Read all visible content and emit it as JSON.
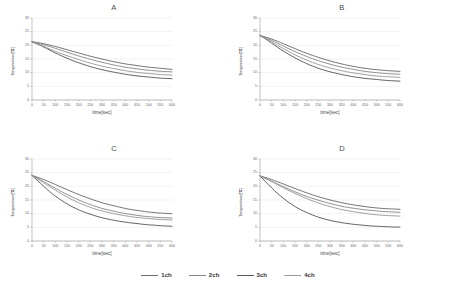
{
  "figure": {
    "title": "",
    "panels": [
      "A",
      "B",
      "C",
      "D"
    ]
  },
  "legend": {
    "position": "bottom-center",
    "items": [
      {
        "label": "1ch",
        "color": "#6b6b6b"
      },
      {
        "label": "2ch",
        "color": "#8a8a8a"
      },
      {
        "label": "3ch",
        "color": "#5a5a5a"
      },
      {
        "label": "4ch",
        "color": "#9a9a9a"
      }
    ]
  },
  "axes": {
    "xlabel": "time[sec]",
    "ylabel": "Temperature[℃]",
    "xticks": [
      0,
      50,
      100,
      150,
      200,
      250,
      300,
      350,
      400,
      450,
      500,
      550,
      600
    ],
    "yticks": [
      0,
      5,
      10,
      15,
      20,
      25,
      30
    ],
    "xlim": [
      0,
      600
    ],
    "ylim": [
      0,
      30
    ],
    "grid": "horizontal"
  },
  "chart_data": [
    {
      "type": "line",
      "title": "A",
      "xlabel": "time[sec]",
      "ylabel": "Temperature[℃]",
      "xlim": [
        0,
        600
      ],
      "ylim": [
        0,
        30
      ],
      "grid": true,
      "x": [
        0,
        25,
        50,
        75,
        100,
        125,
        150,
        175,
        200,
        225,
        250,
        275,
        300,
        325,
        350,
        375,
        400,
        425,
        450,
        475,
        500,
        525,
        550,
        575,
        600
      ],
      "series": [
        {
          "name": "1ch",
          "color": "#6b6b6b",
          "values": [
            21.3,
            21.0,
            20.6,
            20.1,
            19.6,
            19.0,
            18.4,
            17.8,
            17.2,
            16.6,
            16.0,
            15.5,
            15.0,
            14.5,
            14.0,
            13.6,
            13.2,
            12.9,
            12.6,
            12.3,
            12.0,
            11.8,
            11.6,
            11.4,
            11.2
          ]
        },
        {
          "name": "2ch",
          "color": "#8a8a8a",
          "values": [
            21.3,
            20.8,
            20.2,
            19.6,
            18.9,
            18.2,
            17.5,
            16.8,
            16.1,
            15.5,
            14.9,
            14.3,
            13.8,
            13.3,
            12.8,
            12.4,
            12.0,
            11.7,
            11.4,
            11.1,
            10.9,
            10.7,
            10.5,
            10.4,
            10.3
          ]
        },
        {
          "name": "3ch",
          "color": "#5a5a5a",
          "values": [
            21.3,
            20.4,
            19.4,
            18.3,
            17.2,
            16.2,
            15.3,
            14.4,
            13.6,
            12.9,
            12.2,
            11.6,
            11.1,
            10.6,
            10.2,
            9.8,
            9.4,
            9.1,
            8.8,
            8.6,
            8.4,
            8.2,
            8.0,
            7.9,
            7.8
          ]
        },
        {
          "name": "4ch",
          "color": "#9a9a9a",
          "values": [
            21.3,
            20.5,
            19.6,
            18.7,
            17.8,
            17.0,
            16.2,
            15.5,
            14.8,
            14.1,
            13.5,
            12.9,
            12.4,
            11.9,
            11.5,
            11.1,
            10.7,
            10.4,
            10.1,
            9.9,
            9.7,
            9.5,
            9.3,
            9.2,
            9.1
          ]
        }
      ]
    },
    {
      "type": "line",
      "title": "B",
      "xlabel": "time[sec]",
      "ylabel": "Temperature[℃]",
      "xlim": [
        0,
        600
      ],
      "ylim": [
        0,
        30
      ],
      "grid": true,
      "x": [
        0,
        25,
        50,
        75,
        100,
        125,
        150,
        175,
        200,
        225,
        250,
        275,
        300,
        325,
        350,
        375,
        400,
        425,
        450,
        475,
        500,
        525,
        550,
        575,
        600
      ],
      "series": [
        {
          "name": "1ch",
          "color": "#6b6b6b",
          "values": [
            23.6,
            23.0,
            22.3,
            21.5,
            20.6,
            19.7,
            18.8,
            17.9,
            17.1,
            16.3,
            15.6,
            14.9,
            14.3,
            13.7,
            13.2,
            12.7,
            12.3,
            11.9,
            11.6,
            11.3,
            11.1,
            10.9,
            10.7,
            10.6,
            10.5
          ]
        },
        {
          "name": "2ch",
          "color": "#8a8a8a",
          "values": [
            23.6,
            22.7,
            21.8,
            20.8,
            19.7,
            18.7,
            17.7,
            16.8,
            15.9,
            15.1,
            14.4,
            13.7,
            13.1,
            12.5,
            12.0,
            11.6,
            11.2,
            10.8,
            10.5,
            10.2,
            10.0,
            9.8,
            9.6,
            9.5,
            9.4
          ]
        },
        {
          "name": "3ch",
          "color": "#5a5a5a",
          "values": [
            23.6,
            22.3,
            20.8,
            19.3,
            17.9,
            16.6,
            15.4,
            14.3,
            13.3,
            12.4,
            11.6,
            10.9,
            10.3,
            9.8,
            9.3,
            8.9,
            8.5,
            8.2,
            7.9,
            7.7,
            7.5,
            7.3,
            7.1,
            7.0,
            6.9
          ]
        },
        {
          "name": "4ch",
          "color": "#9a9a9a",
          "values": [
            23.6,
            22.5,
            21.3,
            20.0,
            18.8,
            17.6,
            16.5,
            15.5,
            14.6,
            13.7,
            13.0,
            12.3,
            11.7,
            11.2,
            10.7,
            10.3,
            9.9,
            9.6,
            9.3,
            9.0,
            8.8,
            8.6,
            8.5,
            8.4,
            8.3
          ]
        }
      ]
    },
    {
      "type": "line",
      "title": "C",
      "xlabel": "time[sec]",
      "ylabel": "Temperature[℃]",
      "xlim": [
        0,
        600
      ],
      "ylim": [
        0,
        30
      ],
      "grid": true,
      "x": [
        0,
        25,
        50,
        75,
        100,
        125,
        150,
        175,
        200,
        225,
        250,
        275,
        300,
        325,
        350,
        375,
        400,
        425,
        450,
        475,
        500,
        525,
        550,
        575,
        600
      ],
      "series": [
        {
          "name": "1ch",
          "color": "#6b6b6b",
          "values": [
            24.0,
            23.3,
            22.5,
            21.6,
            20.7,
            19.7,
            18.8,
            17.9,
            17.0,
            16.2,
            15.4,
            14.7,
            14.0,
            13.4,
            12.9,
            12.4,
            11.9,
            11.5,
            11.2,
            10.9,
            10.6,
            10.4,
            10.2,
            10.1,
            10.0
          ]
        },
        {
          "name": "2ch",
          "color": "#8a8a8a",
          "values": [
            24.0,
            22.9,
            21.7,
            20.5,
            19.3,
            18.1,
            17.0,
            16.0,
            15.0,
            14.1,
            13.3,
            12.6,
            11.9,
            11.4,
            10.9,
            10.4,
            10.0,
            9.7,
            9.4,
            9.1,
            8.9,
            8.7,
            8.6,
            8.5,
            8.4
          ]
        },
        {
          "name": "3ch",
          "color": "#5a5a5a",
          "values": [
            24.0,
            22.0,
            20.0,
            18.1,
            16.4,
            14.9,
            13.6,
            12.4,
            11.4,
            10.5,
            9.8,
            9.1,
            8.5,
            8.0,
            7.6,
            7.2,
            6.9,
            6.6,
            6.4,
            6.1,
            5.9,
            5.8,
            5.6,
            5.5,
            5.4
          ]
        },
        {
          "name": "4ch",
          "color": "#9a9a9a",
          "values": [
            24.0,
            22.7,
            21.3,
            19.9,
            18.6,
            17.3,
            16.1,
            15.0,
            14.0,
            13.1,
            12.3,
            11.6,
            11.0,
            10.5,
            10.0,
            9.6,
            9.2,
            8.9,
            8.6,
            8.4,
            8.2,
            8.0,
            7.9,
            7.8,
            7.7
          ]
        }
      ]
    },
    {
      "type": "line",
      "title": "D",
      "xlabel": "time[sec]",
      "ylabel": "Temperature[℃]",
      "xlim": [
        0,
        600
      ],
      "ylim": [
        0,
        30
      ],
      "grid": true,
      "x": [
        0,
        25,
        50,
        75,
        100,
        125,
        150,
        175,
        200,
        225,
        250,
        275,
        300,
        325,
        350,
        375,
        400,
        425,
        450,
        475,
        500,
        525,
        550,
        575,
        600
      ],
      "series": [
        {
          "name": "1ch",
          "color": "#6b6b6b",
          "values": [
            23.8,
            23.2,
            22.5,
            21.7,
            20.9,
            20.0,
            19.2,
            18.4,
            17.6,
            16.9,
            16.2,
            15.6,
            15.0,
            14.5,
            14.0,
            13.6,
            13.2,
            12.9,
            12.6,
            12.3,
            12.1,
            11.9,
            11.8,
            11.7,
            11.6
          ]
        },
        {
          "name": "2ch",
          "color": "#8a8a8a",
          "values": [
            23.8,
            22.9,
            21.9,
            20.9,
            19.9,
            18.9,
            18.0,
            17.1,
            16.3,
            15.6,
            14.9,
            14.3,
            13.7,
            13.2,
            12.7,
            12.3,
            12.0,
            11.7,
            11.4,
            11.2,
            11.0,
            10.8,
            10.7,
            10.6,
            10.5
          ]
        },
        {
          "name": "3ch",
          "color": "#5a5a5a",
          "values": [
            23.8,
            21.6,
            19.4,
            17.4,
            15.6,
            14.0,
            12.6,
            11.4,
            10.4,
            9.5,
            8.7,
            8.1,
            7.5,
            7.1,
            6.7,
            6.4,
            6.1,
            5.9,
            5.7,
            5.5,
            5.4,
            5.3,
            5.2,
            5.1,
            5.1
          ]
        },
        {
          "name": "4ch",
          "color": "#9a9a9a",
          "values": [
            23.8,
            22.8,
            21.7,
            20.6,
            19.5,
            18.4,
            17.4,
            16.4,
            15.5,
            14.7,
            13.9,
            13.2,
            12.6,
            12.0,
            11.5,
            11.1,
            10.7,
            10.4,
            10.1,
            9.8,
            9.6,
            9.4,
            9.3,
            9.2,
            9.1
          ]
        }
      ]
    }
  ]
}
